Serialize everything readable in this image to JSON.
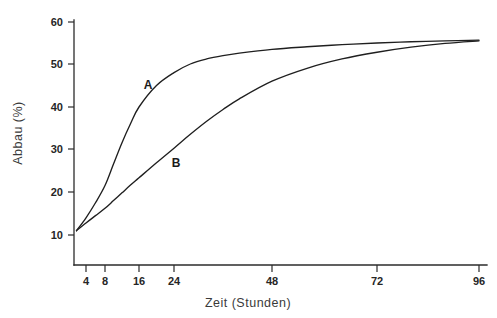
{
  "chart_data": {
    "type": "line",
    "title": "",
    "subtitle": "",
    "xlabel": "Zeit (Stunden)",
    "ylabel": "Abbau (%)",
    "xlim": [
      0,
      100
    ],
    "ylim": [
      5,
      63
    ],
    "grid": false,
    "legend_position": "inline-curve-labels",
    "x_ticks": [
      4,
      8,
      16,
      24,
      48,
      72,
      96
    ],
    "x_tick_labels": [
      "4",
      "8",
      "16",
      "24",
      "48",
      "72",
      "96"
    ],
    "y_ticks": [
      10,
      20,
      30,
      40,
      50,
      60
    ],
    "y_tick_labels": [
      "10",
      "20",
      "30",
      "40",
      "50",
      "60"
    ],
    "annotations": [
      {
        "text": "A",
        "x": 12,
        "y": 45.5
      },
      {
        "text": "B",
        "x": 20.5,
        "y": 27.5
      }
    ],
    "series": [
      {
        "name": "A",
        "label": "A",
        "color": "#1f1f1f",
        "x": [
          2,
          4,
          6,
          8,
          10,
          12,
          14,
          16,
          20,
          24,
          28,
          32,
          36,
          40,
          48,
          56,
          64,
          72,
          80,
          88,
          96
        ],
        "values": [
          11.0,
          14.0,
          17.5,
          21.5,
          26.5,
          31.5,
          36.0,
          40.0,
          45.0,
          48.0,
          50.0,
          51.2,
          52.0,
          52.6,
          53.5,
          54.1,
          54.6,
          55.0,
          55.3,
          55.5,
          55.7
        ]
      },
      {
        "name": "B",
        "label": "B",
        "color": "#1f1f1f",
        "x": [
          2,
          4,
          6,
          8,
          10,
          12,
          14,
          16,
          20,
          24,
          28,
          32,
          36,
          40,
          48,
          56,
          64,
          72,
          80,
          88,
          96
        ],
        "values": [
          11.0,
          12.8,
          14.5,
          16.2,
          18.0,
          19.8,
          21.6,
          23.3,
          26.8,
          30.2,
          33.5,
          36.6,
          39.4,
          41.9,
          46.0,
          49.0,
          51.2,
          52.8,
          54.0,
          54.9,
          55.5
        ]
      }
    ]
  },
  "axes": {
    "y_title": "Abbau (%)",
    "x_title": "Zeit (Stunden)"
  }
}
